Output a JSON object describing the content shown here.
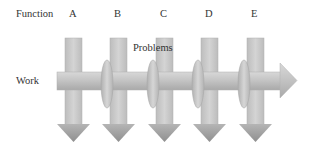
{
  "diagram": {
    "row_label_function": "Function",
    "row_label_work": "Work",
    "problems_label": "Problems",
    "functions": [
      {
        "label": "A",
        "x": 65
      },
      {
        "label": "B",
        "x": 110
      },
      {
        "label": "C",
        "x": 156
      },
      {
        "label": "D",
        "x": 201
      },
      {
        "label": "E",
        "x": 247
      }
    ],
    "problems_count": 4,
    "colors": {
      "bar_fill": "#c9c9c9",
      "bar_stroke": "#a8a8a8",
      "arrow_dark": "#8e8e8e",
      "text": "#333333"
    }
  }
}
